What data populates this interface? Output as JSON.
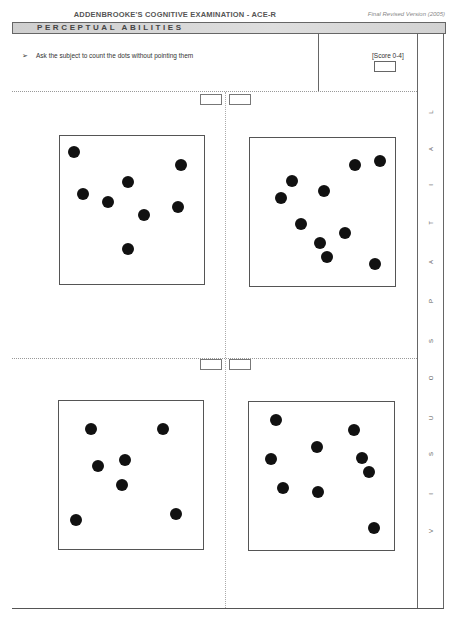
{
  "header": {
    "title": "ADDENBROOKE'S COGNITIVE EXAMINATION - ACE-R",
    "version": "Final Revised Version (2005)"
  },
  "section": {
    "title": "PERCEPTUAL ABILITIES",
    "side_label": "VISUOSPATIAL",
    "side_letters": [
      "V",
      "I",
      "S",
      "U",
      "O",
      "S",
      "P",
      "A",
      "T",
      "I",
      "A",
      "L"
    ]
  },
  "instruction": {
    "bullet": "➢",
    "text": "Ask the subject to count the dots without pointing them"
  },
  "score": {
    "label": "[Score 0-4]",
    "value": ""
  },
  "panels": [
    {
      "name": "dot-panel-1",
      "dot_count": 8,
      "answer": "",
      "dots": [
        [
          74,
          152
        ],
        [
          181,
          165
        ],
        [
          128,
          182
        ],
        [
          83,
          194
        ],
        [
          108,
          202
        ],
        [
          178,
          207
        ],
        [
          144,
          215
        ],
        [
          128,
          249
        ]
      ]
    },
    {
      "name": "dot-panel-2",
      "dot_count": 10,
      "answer": "",
      "dots": [
        [
          355,
          165
        ],
        [
          380,
          161
        ],
        [
          292,
          181
        ],
        [
          324,
          191
        ],
        [
          281,
          198
        ],
        [
          301,
          224
        ],
        [
          345,
          233
        ],
        [
          320,
          243
        ],
        [
          327,
          257
        ],
        [
          375,
          264
        ]
      ]
    },
    {
      "name": "dot-panel-3",
      "dot_count": 7,
      "answer": "",
      "dots": [
        [
          91,
          429
        ],
        [
          163,
          429
        ],
        [
          98,
          466
        ],
        [
          125,
          460
        ],
        [
          122,
          485
        ],
        [
          76,
          520
        ],
        [
          176,
          514
        ]
      ]
    },
    {
      "name": "dot-panel-4",
      "dot_count": 9,
      "answer": "",
      "dots": [
        [
          276,
          420
        ],
        [
          354,
          430
        ],
        [
          317,
          447
        ],
        [
          271,
          459
        ],
        [
          362,
          458
        ],
        [
          369,
          472
        ],
        [
          283,
          488
        ],
        [
          318,
          492
        ],
        [
          374,
          528
        ]
      ]
    }
  ],
  "colors": {
    "section_bar": "#d6d6d6",
    "border": "#555555",
    "dot": "#111111"
  }
}
